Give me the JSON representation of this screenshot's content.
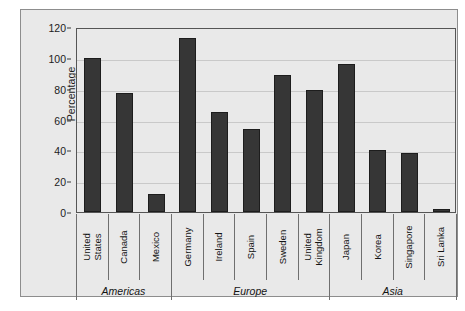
{
  "chart_data": {
    "type": "bar",
    "title": "",
    "xlabel": "",
    "ylabel": "Percentage",
    "ylim": [
      0,
      120
    ],
    "yticks": [
      0,
      20,
      40,
      60,
      80,
      100,
      120
    ],
    "ytick_labels": [
      "0",
      "20",
      "40",
      "60",
      "80",
      "100",
      "120"
    ],
    "grid": true,
    "legend": "none",
    "categories": [
      "United States",
      "Canada",
      "Mexico",
      "Germany",
      "Ireland",
      "Spain",
      "Sweden",
      "United Kingdom",
      "Japan",
      "Korea",
      "Singapore",
      "Sri Lanka"
    ],
    "category_lines": [
      [
        "United",
        "States"
      ],
      [
        "Canada"
      ],
      [
        "Mexico"
      ],
      [
        "Germany"
      ],
      [
        "Ireland"
      ],
      [
        "Spain"
      ],
      [
        "Sweden"
      ],
      [
        "United",
        "Kingdom"
      ],
      [
        "Japan"
      ],
      [
        "Korea"
      ],
      [
        "Singapore"
      ],
      [
        "Sri Lanka"
      ]
    ],
    "values": [
      100,
      77,
      12,
      113,
      65,
      54,
      89,
      79,
      96,
      40,
      38,
      2
    ],
    "groups": [
      {
        "label": "Americas",
        "start": 0,
        "end": 2
      },
      {
        "label": "Europe",
        "start": 3,
        "end": 7
      },
      {
        "label": "Asia",
        "start": 8,
        "end": 11
      }
    ],
    "colors": {
      "bar": "#363636",
      "bar_edge": "#1d1d1d",
      "plot_background": "#e9e9e9",
      "gridline": "#c9c9c9",
      "axis": "#555555",
      "text": "#141414"
    }
  }
}
